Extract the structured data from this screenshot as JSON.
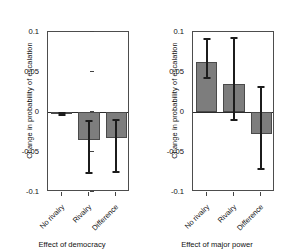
{
  "chart_data": [
    {
      "type": "bar",
      "title": "",
      "xlabel": "Effect of democracy",
      "ylabel": "Change in probability of escalation",
      "categories": [
        "No rivalry",
        "Rivalry",
        "Difference"
      ],
      "values": [
        -0.002,
        -0.035,
        -0.033
      ],
      "error_low": [
        -0.004,
        -0.076,
        -0.075
      ],
      "error_high": [
        -0.001,
        -0.011,
        -0.01
      ],
      "ylim": [
        -0.1,
        0.1
      ],
      "yticks": [
        0.1,
        0.05,
        0,
        -0.05,
        -0.1
      ],
      "ytick_labels": [
        "0.1",
        "0.05",
        "0",
        "-0.05",
        "-0.1"
      ],
      "grid": false,
      "legend": "none",
      "bar_color": "#7d7d7d",
      "error_color": "#1c1c1c"
    },
    {
      "type": "bar",
      "title": "",
      "xlabel": "Effect of major power",
      "ylabel": "Change in probability of escalation",
      "categories": [
        "No rivalry",
        "Rivalry",
        "Difference"
      ],
      "values": [
        0.063,
        0.035,
        -0.028
      ],
      "error_low": [
        0.043,
        -0.01,
        -0.071
      ],
      "error_high": [
        0.091,
        0.093,
        0.031
      ],
      "ylim": [
        -0.1,
        0.1
      ],
      "yticks": [
        0.1,
        0.05,
        0,
        -0.05,
        -0.1
      ],
      "ytick_labels": [
        "0.1",
        "0.05",
        "0",
        "-0.05",
        "-0.1"
      ],
      "grid": false,
      "legend": "none",
      "bar_color": "#7d7d7d",
      "error_color": "#1c1c1c"
    }
  ],
  "panels": [
    {
      "id": "democracy",
      "ylabel": "Change in probability of escalation",
      "xtitle": "Effect of democracy",
      "ytick_labels": [
        "0.1",
        "0.05",
        "0",
        "-0.05",
        "-0.1"
      ],
      "xtick_labels": [
        "No rivalry",
        "Rivalry",
        "Difference"
      ]
    },
    {
      "id": "major-power",
      "ylabel": "Change in probability of escalation",
      "xtitle": "Effect of major power",
      "ytick_labels": [
        "0.1",
        "0.05",
        "0",
        "-0.05",
        "-0.1"
      ],
      "xtick_labels": [
        "No rivalry",
        "Rivalry",
        "Difference"
      ]
    }
  ]
}
